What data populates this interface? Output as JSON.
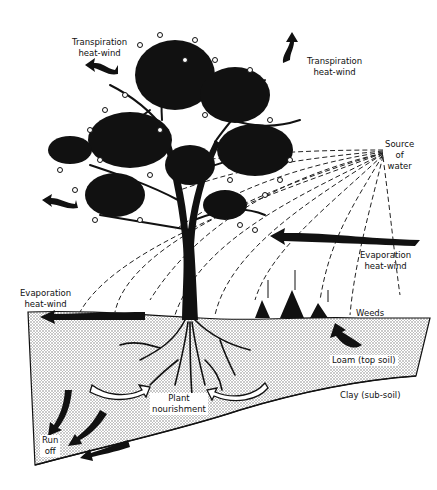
{
  "diagram": {
    "colors": {
      "ink": "#111111",
      "paper": "#ffffff",
      "soil_dots": "#9a9a9a"
    },
    "labels": {
      "transpiration_left": {
        "line1": "Transpiration",
        "line2": "heat-wind"
      },
      "transpiration_right": {
        "line1": "Transpiration",
        "line2": "heat-wind"
      },
      "source_of_water": {
        "line1": "Source",
        "line2": "of",
        "line3": "water"
      },
      "evaporation_right": {
        "line1": "Evaporation",
        "line2": "heat-wind"
      },
      "evaporation_left": {
        "line1": "Evaporation",
        "line2": "heat-wind"
      },
      "weeds": "Weeds",
      "loam": "Loam (top soil)",
      "clay": "Clay (sub-soil)",
      "plant_nourishment": {
        "line1": "Plant",
        "line2": "nourishment"
      },
      "run_off": {
        "line1": "Run",
        "line2": "off"
      }
    },
    "icons": [
      "tree-icon",
      "roots-icon",
      "weeds-icon",
      "wind-arrow-icon",
      "runoff-arrow-icon",
      "nourishment-arrow-icon",
      "water-rays-icon"
    ]
  }
}
